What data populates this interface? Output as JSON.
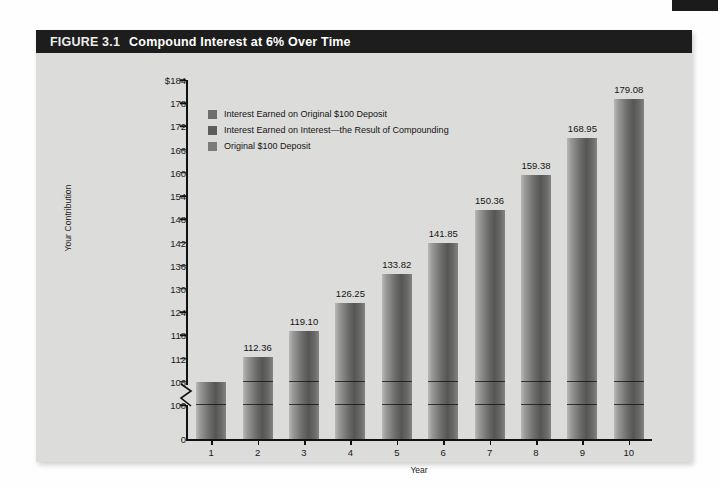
{
  "page": {
    "corner_tab_color": "#1b1b1b",
    "panel_bg": "#dcdcdb",
    "header_bg": "#1d1d1d"
  },
  "figure": {
    "number": "FIGURE 3.1",
    "title": "Compound Interest at 6% Over Time"
  },
  "legend": {
    "items": [
      {
        "label": "Interest Earned on Original $100 Deposit",
        "color": "#6e6e6c"
      },
      {
        "label": "Interest Earned on Interest—the Result of Compounding",
        "color": "#5c5c5a"
      },
      {
        "label": "Original $100 Deposit",
        "color": "#7b7b79"
      }
    ]
  },
  "chart_data": {
    "type": "bar",
    "title": "Compound Interest at 6% Over Time",
    "xlabel": "Year",
    "ylabel": "Your Contribution",
    "categories": [
      "1",
      "2",
      "3",
      "4",
      "5",
      "6",
      "7",
      "8",
      "9",
      "10"
    ],
    "values": [
      106.0,
      112.36,
      119.1,
      126.25,
      133.82,
      141.85,
      150.36,
      159.38,
      168.95,
      179.08
    ],
    "value_labels": [
      "",
      "112.36",
      "119.10",
      "126.25",
      "133.82",
      "141.85",
      "150.36",
      "159.38",
      "168.95",
      "179.08"
    ],
    "series": [
      {
        "name": "Original $100 Deposit",
        "values": [
          100,
          100,
          100,
          100,
          100,
          100,
          100,
          100,
          100,
          100
        ]
      },
      {
        "name": "Interest Earned on Original $100 Deposit",
        "values": [
          6,
          6,
          6,
          6,
          6,
          6,
          6,
          6,
          6,
          6
        ]
      },
      {
        "name": "Interest Earned on Interest—the Result of Compounding",
        "values": [
          0,
          6.36,
          13.1,
          20.25,
          27.82,
          35.85,
          44.36,
          53.38,
          62.95,
          73.08
        ]
      }
    ],
    "ylim": [
      96,
      184
    ],
    "ytick_labels": [
      "$184",
      "178",
      "172",
      "166",
      "160",
      "154",
      "148",
      "142",
      "136",
      "130",
      "124",
      "118",
      "112",
      "106",
      "100",
      "0"
    ],
    "ytick_values": [
      184,
      178,
      172,
      166,
      160,
      154,
      148,
      142,
      136,
      130,
      124,
      118,
      112,
      106,
      100,
      0
    ],
    "axis_break": true,
    "grid": false,
    "legend_position": "top-left",
    "bar_divider_value": 100
  }
}
